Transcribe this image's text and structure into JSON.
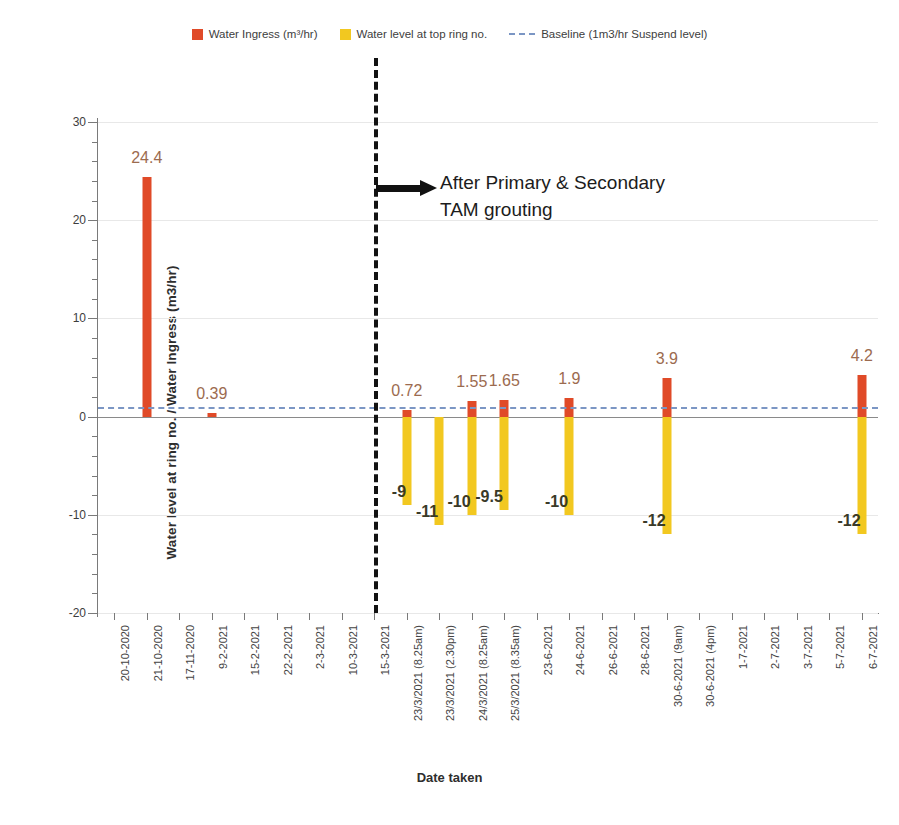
{
  "legend": {
    "items": [
      {
        "label": "Water Ingress (m³/hr)",
        "type": "swatch",
        "color": "#e04a28",
        "icon": "red-square-icon"
      },
      {
        "label": "Water level at top ring no.",
        "type": "swatch",
        "color": "#f2c820",
        "icon": "yellow-square-icon"
      },
      {
        "label": "Baseline (1m3/hr Suspend level)",
        "type": "dash",
        "color": "#7b96c4",
        "icon": "blue-dashed-line-icon"
      }
    ]
  },
  "annotation": {
    "line1": "After Primary & Secondary",
    "line2": "TAM grouting",
    "arrow_icon": "right-arrow-icon"
  },
  "chart_data": {
    "type": "bar",
    "title": "",
    "xlabel": "Date taken",
    "ylabel": "Water level at ring no.  /  Water Ingress (m3/hr)",
    "ylim": [
      -20,
      30
    ],
    "yticks": [
      30,
      20,
      10,
      0,
      -10,
      -20
    ],
    "yminor_step": 2,
    "grid": true,
    "legend_position": "top-center",
    "categories": [
      "20-10-2020",
      "21-10-2020",
      "17-11-2020",
      "9-2-2021",
      "15-2-2021",
      "22-2-2021",
      "2-3-2021",
      "10-3-2021",
      "15-3-2021",
      "23/3/2021 (8.25am)",
      "23/3/2021 (2.30pm)",
      "24/3/2021 (8.25am)",
      "25/3/2021 (8.35am)",
      "23-6-2021",
      "24-6-2021",
      "26-6-2021",
      "28-6-2021",
      "30-6-2021 (9am)",
      "30-6-2021 (4pm)",
      "1-7-2021",
      "2-7-2021",
      "3-7-2021",
      "5-7-2021",
      "6-7-2021"
    ],
    "series": [
      {
        "name": "Water Ingress (m³/hr)",
        "color": "#e04a28",
        "label_color": "#9c6b4f",
        "values": [
          null,
          24.4,
          null,
          0.39,
          null,
          null,
          null,
          null,
          null,
          0.72,
          null,
          1.55,
          1.65,
          null,
          1.9,
          null,
          null,
          3.9,
          null,
          null,
          null,
          null,
          null,
          4.2
        ],
        "labels": [
          null,
          "24.4",
          null,
          "0.39",
          null,
          null,
          null,
          null,
          null,
          "0.72",
          null,
          "1.55",
          "1.65",
          null,
          "1.9",
          null,
          null,
          "3.9",
          null,
          null,
          null,
          null,
          null,
          "4.2"
        ]
      },
      {
        "name": "Water level at top ring no.",
        "color": "#f2c820",
        "label_color": "#3a3a28",
        "values": [
          null,
          null,
          null,
          null,
          null,
          null,
          null,
          null,
          null,
          -9,
          -11,
          -10,
          -9.5,
          null,
          -10,
          null,
          null,
          -12,
          null,
          null,
          null,
          null,
          null,
          -12
        ],
        "labels": [
          null,
          null,
          null,
          null,
          null,
          null,
          null,
          null,
          null,
          "-9",
          "-11",
          "-10",
          "-9.5",
          null,
          "-10",
          null,
          null,
          "-12",
          null,
          null,
          null,
          null,
          null,
          "-12"
        ]
      }
    ],
    "baseline": {
      "value": 1,
      "label": "Baseline (1m3/hr Suspend level)",
      "color": "#7b96c4"
    },
    "divider": {
      "at_category_index": 8,
      "label": "After Primary & Secondary TAM grouting",
      "color": "#121212"
    }
  }
}
